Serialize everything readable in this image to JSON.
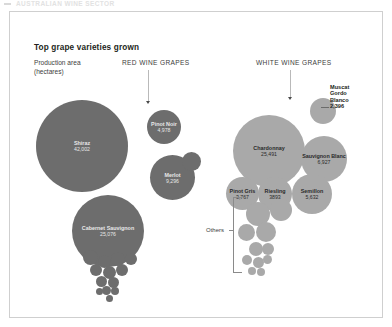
{
  "header": {
    "masthead": "AUSTRALIAN WINE SECTOR"
  },
  "panel": {
    "title": "Top grape varieties grown",
    "legend_line1": "Production area",
    "legend_line2": "(hectares)",
    "section_red": "RED WINE GRAPES",
    "section_white": "WHITE WINE GRAPES",
    "others_label": "Others"
  },
  "chart_data": {
    "type": "bubble",
    "title": "Top grape varieties grown",
    "value_label": "Production area (hectares)",
    "units": "hectares",
    "groups": [
      {
        "name": "RED WINE GRAPES",
        "color": "#6d6d6d",
        "items": [
          {
            "label": "Shiraz",
            "value_text": "42,002",
            "value": 42002
          },
          {
            "label": "Cabernet Sauvignon",
            "value_text": "25,076",
            "value": 25076
          },
          {
            "label": "Merlot",
            "value_text": "9,296",
            "value": 9296
          },
          {
            "label": "Pinot Noir",
            "value_text": "4,978",
            "value": 4978
          }
        ]
      },
      {
        "name": "WHITE WINE GRAPES",
        "color": "#a9a9a9",
        "items": [
          {
            "label": "Chardonnay",
            "value_text": "25,491",
            "value": 25491
          },
          {
            "label": "Sauvignon Blanc",
            "value_text": "6,927",
            "value": 6927
          },
          {
            "label": "Semillon",
            "value_text": "5,632",
            "value": 5632
          },
          {
            "label": "Riesling",
            "value_text": "3893",
            "value": 3893
          },
          {
            "label": "Pinot Gris",
            "value_text": "3,767",
            "value": 3767
          },
          {
            "label": "Muscat Gordo Blanco",
            "value_text": "2,396",
            "value": 2396
          }
        ]
      }
    ],
    "others_group": {
      "label": "Others",
      "note": "cluster of small unlabelled bubbles"
    }
  },
  "bubbles_red": [
    {
      "name": "Shiraz",
      "value": "42,002",
      "x": 26,
      "y": 88,
      "d": 92,
      "labelled": true
    },
    {
      "name": "Pinot Noir",
      "value": "4,978",
      "x": 137,
      "y": 98,
      "d": 34,
      "labelled": true
    },
    {
      "name": "Merlot",
      "value": "9,296",
      "x": 140,
      "y": 143,
      "d": 45,
      "labelled": true
    },
    {
      "name": "",
      "value": "",
      "x": 172,
      "y": 140,
      "d": 19,
      "labelled": false
    },
    {
      "name": "Cabernet Sauvignon",
      "value": "25,076",
      "x": 62,
      "y": 183,
      "d": 72,
      "labelled": true
    }
  ],
  "bubbles_red_cluster": [
    {
      "x": 73,
      "y": 238,
      "d": 15
    },
    {
      "x": 88,
      "y": 243,
      "d": 13
    },
    {
      "x": 101,
      "y": 240,
      "d": 14
    },
    {
      "x": 115,
      "y": 241,
      "d": 12
    },
    {
      "x": 80,
      "y": 252,
      "d": 12
    },
    {
      "x": 93,
      "y": 254,
      "d": 13
    },
    {
      "x": 106,
      "y": 252,
      "d": 12
    },
    {
      "x": 86,
      "y": 264,
      "d": 11
    },
    {
      "x": 98,
      "y": 265,
      "d": 11
    },
    {
      "x": 92,
      "y": 274,
      "d": 9
    },
    {
      "x": 101,
      "y": 275,
      "d": 8
    },
    {
      "x": 86,
      "y": 276,
      "d": 7
    },
    {
      "x": 96,
      "y": 283,
      "d": 7
    }
  ],
  "bubbles_white": [
    {
      "name": "Chardonnay",
      "value": "25,491",
      "x": 223,
      "y": 103,
      "d": 72,
      "labelled": true
    },
    {
      "name": "Sauvignon Blanc",
      "value": "6,927",
      "x": 291,
      "y": 124,
      "d": 46,
      "labelled": true
    },
    {
      "name": "Semillon",
      "value": "5,632",
      "x": 282,
      "y": 162,
      "d": 40,
      "labelled": true
    },
    {
      "name": "",
      "value": "",
      "x": 300,
      "y": 86,
      "d": 26,
      "labelled": false
    },
    {
      "name": "Pinot Gris",
      "value": "3,767",
      "x": 216,
      "y": 165,
      "d": 33,
      "labelled": true
    },
    {
      "name": "Riesling",
      "value": "3893",
      "x": 248,
      "y": 165,
      "d": 34,
      "labelled": true
    }
  ],
  "bubbles_white_cluster": [
    {
      "x": 236,
      "y": 190,
      "d": 24
    },
    {
      "x": 260,
      "y": 187,
      "d": 22
    },
    {
      "x": 228,
      "y": 212,
      "d": 17
    },
    {
      "x": 246,
      "y": 210,
      "d": 20
    },
    {
      "x": 239,
      "y": 230,
      "d": 14
    },
    {
      "x": 252,
      "y": 231,
      "d": 12
    },
    {
      "x": 232,
      "y": 243,
      "d": 10
    },
    {
      "x": 243,
      "y": 245,
      "d": 11
    },
    {
      "x": 253,
      "y": 243,
      "d": 9
    },
    {
      "x": 238,
      "y": 255,
      "d": 8
    },
    {
      "x": 247,
      "y": 256,
      "d": 8
    }
  ],
  "callout": {
    "line1": "Muscat",
    "line2": "Gordo",
    "line3": "Blanco",
    "value": "2,396"
  }
}
